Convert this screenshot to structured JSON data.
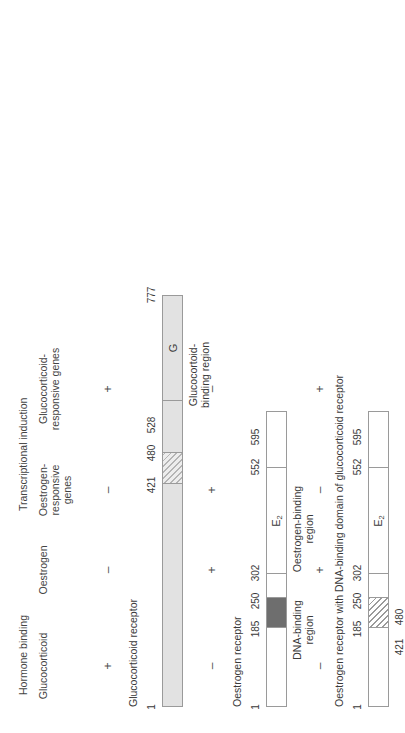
{
  "figure": {
    "type": "domain-swap-schematic",
    "column_groups": [
      {
        "label": "Hormone binding",
        "columns": [
          "Glucocorticoid",
          "Oestrogen"
        ]
      },
      {
        "label": "Transcriptional induction",
        "columns": [
          "Oestrogen-\nresponsive\ngenes",
          "Glucocorticoid-\nresponsive genes"
        ]
      }
    ],
    "flat_columns": [
      "Glucocorticoid",
      "Oestrogen",
      "Oestrogen-\nresponsive\ngenes",
      "Glucocorticoid-\nresponsive genes"
    ],
    "rows": [
      {
        "title": "Glucocorticoid receptor",
        "results": [
          "+",
          "–",
          "–",
          "+"
        ],
        "ticks": [
          "1",
          "421",
          "480",
          "528",
          "777"
        ],
        "segments": [
          {
            "name": "n-terminal",
            "style": "grey",
            "label": ""
          },
          {
            "name": "dna-binding",
            "style": "hatch-on-grey",
            "label": ""
          },
          {
            "name": "hinge",
            "style": "grey",
            "label": ""
          },
          {
            "name": "glucocorticoid-binding",
            "style": "grey",
            "label": "G"
          }
        ],
        "region_labels": [
          {
            "text": "Glucocortoid-\nbinding region",
            "target": "glucocorticoid-binding"
          }
        ]
      },
      {
        "title": "Oestrogen receptor",
        "results": [
          "–",
          "+",
          "+",
          "–"
        ],
        "ticks": [
          "1",
          "185",
          "250",
          "302",
          "552",
          "595"
        ],
        "segments": [
          {
            "name": "n-terminal",
            "style": "white",
            "label": ""
          },
          {
            "name": "dna-binding",
            "style": "dark",
            "label": ""
          },
          {
            "name": "hinge",
            "style": "white",
            "label": ""
          },
          {
            "name": "oestrogen-binding",
            "style": "white",
            "label": "E2"
          },
          {
            "name": "f-domain",
            "style": "white",
            "label": ""
          }
        ],
        "region_labels": [
          {
            "text": "DNA-binding\nregion",
            "target": "dna-binding"
          },
          {
            "text": "Oestrogen-binding\nregion",
            "target": "oestrogen-binding"
          }
        ]
      },
      {
        "title": "Oestrogen receptor with DNA-binding domain of glucocorticoid receptor",
        "results": [
          "–",
          "+",
          "–",
          "+"
        ],
        "ticks": [
          "1",
          "185",
          "250",
          "302",
          "552",
          "595"
        ],
        "ticks_secondary": [
          "421",
          "480"
        ],
        "segments": [
          {
            "name": "n-terminal",
            "style": "white",
            "label": ""
          },
          {
            "name": "dna-binding-swap",
            "style": "hatch",
            "label": ""
          },
          {
            "name": "hinge",
            "style": "white",
            "label": ""
          },
          {
            "name": "oestrogen-binding",
            "style": "white",
            "label": "E2"
          },
          {
            "name": "f-domain",
            "style": "white",
            "label": ""
          }
        ],
        "region_labels": []
      }
    ],
    "colors": {
      "grey_fill": "#e2e2e2",
      "dark_fill": "#6e6e6e",
      "outline": "#9a9a9a",
      "text": "#3a3a3a"
    }
  }
}
